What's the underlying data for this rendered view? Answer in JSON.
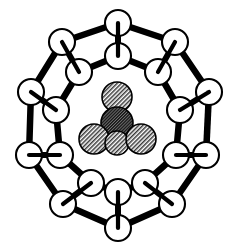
{
  "figure": {
    "caption": "",
    "background_color": "#ffffff",
    "line_color": "#000000",
    "cage_atom_fill": "#ffffff",
    "guest_light_fill": "#b4b4b4",
    "guest_dark_fill": "#555555",
    "width": 236,
    "height": 251
  },
  "chart_data": {
    "type": "scatter",
    "xlabel": "",
    "ylabel": "",
    "grid": false,
    "legend": "none",
    "xlim": [
      0,
      236
    ],
    "ylim": [
      0,
      251
    ],
    "series": [
      {
        "name": "outer-cage-atoms",
        "style": "open-circle",
        "radius": 13,
        "fill": "#ffffff",
        "stroke": "#000000",
        "points": [
          {
            "id": "O1",
            "x": 118,
            "y": 23
          },
          {
            "id": "O2",
            "x": 175,
            "y": 42
          },
          {
            "id": "O3",
            "x": 209,
            "y": 92
          },
          {
            "id": "O4",
            "x": 206,
            "y": 155
          },
          {
            "id": "O5",
            "x": 172,
            "y": 204
          },
          {
            "id": "O6",
            "x": 118,
            "y": 228
          },
          {
            "id": "O7",
            "x": 63,
            "y": 204
          },
          {
            "id": "O8",
            "x": 29,
            "y": 155
          },
          {
            "id": "O9",
            "x": 31,
            "y": 92
          },
          {
            "id": "O10",
            "x": 62,
            "y": 42
          }
        ]
      },
      {
        "name": "inner-cage-atoms",
        "style": "open-circle",
        "radius": 13,
        "fill": "#ffffff",
        "stroke": "#000000",
        "points": [
          {
            "id": "I1",
            "x": 118,
            "y": 56
          },
          {
            "id": "I2",
            "x": 158,
            "y": 72
          },
          {
            "id": "I3",
            "x": 180,
            "y": 110
          },
          {
            "id": "I4",
            "x": 176,
            "y": 155
          },
          {
            "id": "I5",
            "x": 145,
            "y": 183
          },
          {
            "id": "I6",
            "x": 118,
            "y": 192
          },
          {
            "id": "I7",
            "x": 91,
            "y": 183
          },
          {
            "id": "I8",
            "x": 60,
            "y": 155
          },
          {
            "id": "I9",
            "x": 56,
            "y": 110
          },
          {
            "id": "I10",
            "x": 79,
            "y": 72
          }
        ]
      },
      {
        "name": "guest-cluster-atoms",
        "style": "hatched-circle",
        "points": [
          {
            "id": "G-top",
            "x": 117,
            "y": 97,
            "r": 15,
            "shade": "light"
          },
          {
            "id": "G-center",
            "x": 117,
            "y": 123,
            "r": 16,
            "shade": "dark"
          },
          {
            "id": "G-bottom-left",
            "x": 94,
            "y": 139,
            "r": 15,
            "shade": "light"
          },
          {
            "id": "G-bottom-mid",
            "x": 117,
            "y": 143,
            "r": 12,
            "shade": "light"
          },
          {
            "id": "G-bottom-right",
            "x": 141,
            "y": 139,
            "r": 15,
            "shade": "light"
          }
        ]
      }
    ],
    "edges": {
      "outer_ring": [
        [
          "O1",
          "O2"
        ],
        [
          "O2",
          "O3"
        ],
        [
          "O3",
          "O4"
        ],
        [
          "O4",
          "O5"
        ],
        [
          "O5",
          "O6"
        ],
        [
          "O6",
          "O7"
        ],
        [
          "O7",
          "O8"
        ],
        [
          "O8",
          "O9"
        ],
        [
          "O9",
          "O10"
        ],
        [
          "O10",
          "O1"
        ]
      ],
      "inner_ring": [
        [
          "I1",
          "I2"
        ],
        [
          "I2",
          "I3"
        ],
        [
          "I3",
          "I4"
        ],
        [
          "I4",
          "I5"
        ],
        [
          "I5",
          "I6"
        ],
        [
          "I6",
          "I7"
        ],
        [
          "I7",
          "I8"
        ],
        [
          "I8",
          "I9"
        ],
        [
          "I9",
          "I10"
        ],
        [
          "I10",
          "I1"
        ]
      ],
      "radial_stubs": [
        [
          "O1",
          "I1"
        ],
        [
          "O2",
          "I2"
        ],
        [
          "O3",
          "I3"
        ],
        [
          "O4",
          "I4"
        ],
        [
          "O5",
          "I5"
        ],
        [
          "O6",
          "I6"
        ],
        [
          "O7",
          "I7"
        ],
        [
          "O8",
          "I8"
        ],
        [
          "O9",
          "I9"
        ],
        [
          "O10",
          "I10"
        ]
      ]
    }
  }
}
